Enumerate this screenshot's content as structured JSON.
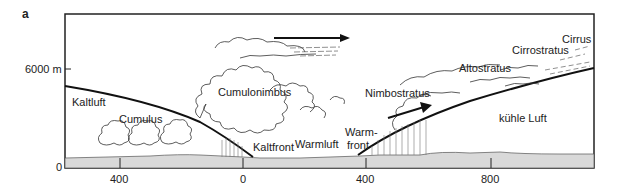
{
  "panel_label": "a",
  "y_axis": {
    "tick_6000": "6000 m",
    "tick_0": "0"
  },
  "x_axis": {
    "ticks": [
      "400",
      "0",
      "400",
      "800"
    ]
  },
  "labels": {
    "kaltluft": "Kaltluft",
    "cumulus": "Cumulus",
    "cumulonimbus": "Cumulonimbus",
    "kaltfront": "Kaltfront",
    "warmluft": "Warmluft",
    "warmfront_1": "Warm-",
    "warmfront_2": "front",
    "nimbostratus": "Nimbostratus",
    "altostratus": "Altostratus",
    "cirrostratus": "Cirrostratus",
    "cirrus": "Cirrus",
    "kuehle_luft": "kühle Luft"
  },
  "colors": {
    "line": "#111111",
    "ground": "#d8d8d8",
    "frame": "#222222"
  }
}
